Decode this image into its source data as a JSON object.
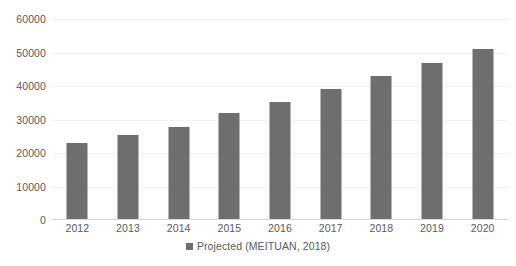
{
  "chart_data": {
    "type": "bar",
    "title": "",
    "subtitle": "",
    "xlabel": "",
    "ylabel": "",
    "categories": [
      "2012",
      "2013",
      "2014",
      "2015",
      "2016",
      "2017",
      "2018",
      "2019",
      "2020"
    ],
    "values": [
      23000,
      25500,
      27700,
      32000,
      35200,
      39000,
      43000,
      47000,
      51000
    ],
    "series": [
      {
        "name": "Projected (MEITUAN, 2018)",
        "values": [
          23000,
          25500,
          27700,
          32000,
          35200,
          39000,
          43000,
          47000,
          51000
        ],
        "color": "#6e6e6e"
      }
    ],
    "ylim": [
      0,
      60000
    ],
    "y_ticks": [
      0,
      10000,
      20000,
      30000,
      40000,
      50000,
      60000
    ],
    "y_tick_labels": [
      "0",
      "10000",
      "20000",
      "30000",
      "40000",
      "50000",
      "60000"
    ],
    "grid": true,
    "grid_axis": "y",
    "legend": {
      "position": "bottom",
      "entries": [
        {
          "label": "Projected (MEITUAN, 2018)",
          "color": "#6e6e6e",
          "marker": "square"
        }
      ]
    },
    "colors": {
      "bar": "#6e6e6e",
      "text": "#5a5a5a",
      "gridline": "#f2f2f2",
      "axis": "#d9d9d9",
      "background": "#ffffff"
    }
  }
}
